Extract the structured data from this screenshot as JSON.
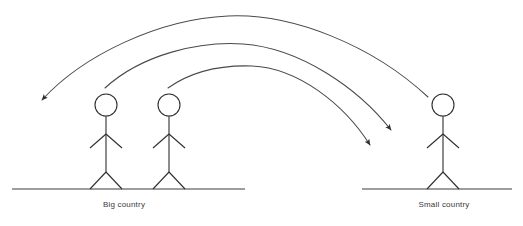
{
  "canvas": {
    "width": 523,
    "height": 226,
    "background": "#ffffff"
  },
  "style": {
    "line_color": "#2e2e2e",
    "arc_color": "#4a4a4a",
    "ground_color": "#3d3d3d",
    "text_color": "#3a3a3a",
    "font_size_px": 8
  },
  "labels": {
    "big_country": "Big country",
    "small_country": "Small country"
  },
  "groups": [
    {
      "name": "big-country-group",
      "label": "Big country",
      "label_x": 124,
      "label_y": 207,
      "ground": {
        "x1": 12,
        "x2": 245,
        "y": 189
      },
      "figures": [
        {
          "name": "figure-big-1",
          "head_cx": 106,
          "head_cy": 105,
          "head_r": 11
        },
        {
          "name": "figure-big-2",
          "head_cx": 169,
          "head_cy": 105,
          "head_r": 11
        }
      ]
    },
    {
      "name": "small-country-group",
      "label": "Small country",
      "label_x": 444,
      "label_y": 207,
      "ground": {
        "x1": 362,
        "x2": 512,
        "y": 189
      },
      "figures": [
        {
          "name": "figure-small-1",
          "head_cx": 443,
          "head_cy": 105,
          "head_r": 11
        }
      ]
    }
  ],
  "arrows": [
    {
      "name": "arrow-outer-right-to-left",
      "direction": "right-to-left",
      "start_x": 428,
      "start_y": 97,
      "apex_x": 228,
      "apex_y": 16,
      "end_x": 38,
      "end_y": 103,
      "arrowhead": "end"
    },
    {
      "name": "arrow-middle-left-to-right",
      "direction": "left-to-right",
      "start_x": 105,
      "start_y": 88,
      "apex_x": 243,
      "apex_y": 44,
      "end_x": 394,
      "end_y": 134,
      "arrowhead": "end"
    },
    {
      "name": "arrow-inner-left-to-right",
      "direction": "left-to-right",
      "start_x": 168,
      "start_y": 88,
      "apex_x": 252,
      "apex_y": 66,
      "end_x": 373,
      "end_y": 149,
      "arrowhead": "end"
    }
  ]
}
